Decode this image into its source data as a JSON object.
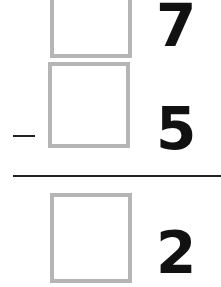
{
  "problem": {
    "operator": "-",
    "rows": [
      {
        "box_value": "",
        "digit": "7"
      },
      {
        "box_value": "",
        "digit": "5"
      },
      {
        "box_value": "",
        "digit": "2"
      }
    ]
  },
  "colors": {
    "box_border": "#b5b5b5",
    "digit": "#111111",
    "line": "#222222"
  }
}
